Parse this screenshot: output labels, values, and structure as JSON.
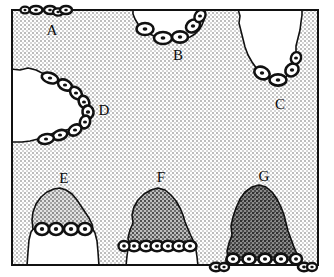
{
  "figure": {
    "kind": "schematic-diagram",
    "frame": {
      "x": 12,
      "y": 10,
      "width": 306,
      "height": 255,
      "border_color": "#111111",
      "border_width_px": 2
    },
    "colors": {
      "background_stipple": "#cfcfcf",
      "background_base": "#e9e9e9",
      "white_region": "#ffffff",
      "mid_gray_dome": "#a8a8a8",
      "dark_gray_dome": "#8a8a8a",
      "darkest_gray_dome": "#6f6f6f",
      "outline": "#111111",
      "label_color": "#0a0a0a",
      "cell_fill": "#ffffff",
      "cell_outline": "#111111",
      "cell_nucleus": "#111111"
    },
    "labels": [
      {
        "id": "A",
        "text": "A",
        "x": 52,
        "y": 32,
        "describes": "cell cluster resting on the upper frame line, upper-left"
      },
      {
        "id": "B",
        "text": "B",
        "x": 178,
        "y": 57,
        "describes": "white embayment descending from the top edge, centre"
      },
      {
        "id": "C",
        "text": "C",
        "x": 280,
        "y": 106,
        "describes": "narrow white V-shaped embayment from top edge, right"
      },
      {
        "id": "D",
        "text": "D",
        "x": 104,
        "y": 112,
        "describes": "white wedge protruding from the left edge"
      },
      {
        "id": "E",
        "text": "E",
        "x": 64,
        "y": 180,
        "describes": "low mid-gray mound, cells at mid height, lower-left"
      },
      {
        "id": "F",
        "text": "F",
        "x": 161,
        "y": 179,
        "describes": "taller dark-gray mound, cells near the base, lower-centre"
      },
      {
        "id": "G",
        "text": "G",
        "x": 264,
        "y": 178,
        "describes": "tallest darkest mound, cells at the base, lower-right"
      }
    ],
    "regions": [
      {
        "id": "A",
        "name": "cell-cluster-on-top-border",
        "fill": "none",
        "cell_count": 5,
        "note": "small dark ellipses sitting above and on the top frame line"
      },
      {
        "id": "B",
        "name": "white-embayment-top-centre",
        "fill": "#ffffff",
        "cell_count": 5,
        "note": "rounded white notch cutting down from the upper edge"
      },
      {
        "id": "C",
        "name": "white-embayment-top-right",
        "fill": "#ffffff",
        "cell_count": 4,
        "note": "narrow tapering white notch from the upper edge"
      },
      {
        "id": "D",
        "name": "white-wedge-left",
        "fill": "#ffffff",
        "cell_count": 9,
        "note": "white wedge entering from the left frame edge, apex pointing right"
      },
      {
        "id": "E",
        "name": "mound-light",
        "fill": "#a8a8a8",
        "cell_count": 4,
        "height_rank": 1,
        "note": "lowest mound; gray cap with white lower body, cells at the cap base"
      },
      {
        "id": "F",
        "name": "mound-medium",
        "fill": "#8a8a8a",
        "cell_count": 7,
        "height_rank": 2,
        "note": "intermediate mound; darker fill, cells in a row near the base"
      },
      {
        "id": "G",
        "name": "mound-dark",
        "fill": "#6f6f6f",
        "cell_count": 5,
        "height_rank": 3,
        "note": "tallest and darkest mound, cells along the bottom frame line"
      },
      {
        "id": "H",
        "name": "cells-below-bottom-border",
        "fill": "none",
        "cell_count": 4,
        "note": "two small cell pairs below the bottom frame line"
      }
    ],
    "legend_present": false,
    "axes_present": false,
    "caption": ""
  }
}
